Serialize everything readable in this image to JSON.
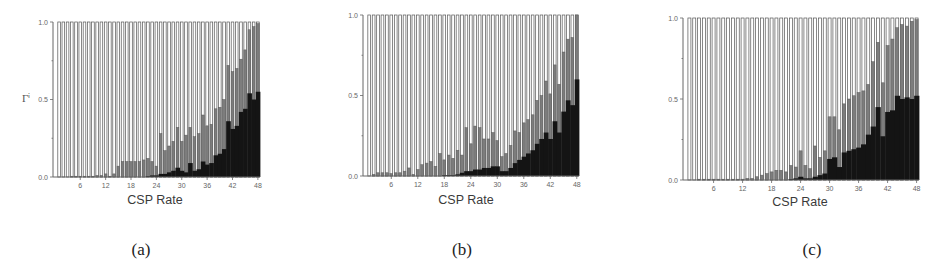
{
  "figure": {
    "panels": [
      {
        "caption": "(a)",
        "xlabel": "CSP Rate",
        "ylabel": "Γⁱ"
      },
      {
        "caption": "(b)",
        "xlabel": "CSP Rate",
        "ylabel": ""
      },
      {
        "caption": "(c)",
        "xlabel": "CSP Rate",
        "ylabel": ""
      }
    ],
    "colors": {
      "light": "#ffffff",
      "mid": "#7d7d7d",
      "dark": "#141414",
      "outline": "#555555"
    }
  },
  "chart_data": [
    {
      "type": "bar",
      "stacked": true,
      "title": "(a)",
      "xlabel": "CSP Rate",
      "ylabel": "Γⁱ",
      "ylim": [
        0,
        1
      ],
      "yticks": [
        "0.0",
        "0.5",
        "1.0"
      ],
      "xticks": [
        6,
        12,
        18,
        24,
        30,
        36,
        42,
        48
      ],
      "x": [
        1,
        2,
        3,
        4,
        5,
        6,
        7,
        8,
        9,
        10,
        11,
        12,
        13,
        14,
        15,
        16,
        17,
        18,
        19,
        20,
        21,
        22,
        23,
        24,
        25,
        26,
        27,
        28,
        29,
        30,
        31,
        32,
        33,
        34,
        35,
        36,
        37,
        38,
        39,
        40,
        41,
        42,
        43,
        44,
        45,
        46,
        47,
        48
      ],
      "series": [
        {
          "name": "dark",
          "values": [
            0,
            0,
            0,
            0,
            0,
            0,
            0,
            0,
            0,
            0,
            0,
            0,
            0,
            0,
            0,
            0,
            0,
            0,
            0,
            0,
            0,
            0.005,
            0.01,
            0.01,
            0.02,
            0.02,
            0.03,
            0.04,
            0.06,
            0.04,
            0.03,
            0.09,
            0.04,
            0.05,
            0.1,
            0.08,
            0.09,
            0.14,
            0.15,
            0.18,
            0.36,
            0.31,
            0.33,
            0.42,
            0.44,
            0.54,
            0.5,
            0.55
          ]
        },
        {
          "name": "mid_top",
          "values": [
            0,
            0,
            0,
            0.005,
            0.005,
            0.005,
            0.005,
            0.005,
            0.005,
            0.01,
            0.01,
            0.02,
            0.005,
            0.02,
            0.07,
            0.1,
            0.1,
            0.1,
            0.1,
            0.1,
            0.11,
            0.12,
            0.1,
            0.07,
            0.28,
            0.17,
            0.2,
            0.23,
            0.32,
            0.23,
            0.27,
            0.32,
            0.26,
            0.28,
            0.4,
            0.33,
            0.34,
            0.44,
            0.45,
            0.5,
            0.72,
            0.68,
            0.7,
            0.76,
            0.82,
            0.95,
            0.97,
            0.99
          ]
        },
        {
          "name": "white_top",
          "values": [
            1,
            1,
            1,
            1,
            1,
            1,
            1,
            1,
            1,
            1,
            1,
            1,
            1,
            1,
            1,
            1,
            1,
            1,
            1,
            1,
            1,
            1,
            1,
            1,
            1,
            1,
            1,
            1,
            1,
            1,
            1,
            1,
            1,
            1,
            1,
            1,
            1,
            1,
            1,
            1,
            1,
            1,
            1,
            1,
            1,
            1,
            1,
            1
          ]
        }
      ]
    },
    {
      "type": "bar",
      "stacked": true,
      "title": "(b)",
      "xlabel": "CSP Rate",
      "ylabel": "",
      "ylim": [
        0,
        1
      ],
      "yticks": [
        "0.0",
        "0.5",
        "1.0"
      ],
      "xticks": [
        6,
        12,
        18,
        24,
        30,
        36,
        42,
        48
      ],
      "x": [
        1,
        2,
        3,
        4,
        5,
        6,
        7,
        8,
        9,
        10,
        11,
        12,
        13,
        14,
        15,
        16,
        17,
        18,
        19,
        20,
        21,
        22,
        23,
        24,
        25,
        26,
        27,
        28,
        29,
        30,
        31,
        32,
        33,
        34,
        35,
        36,
        37,
        38,
        39,
        40,
        41,
        42,
        43,
        44,
        45,
        46,
        47,
        48
      ],
      "series": [
        {
          "name": "dark",
          "values": [
            0,
            0,
            0,
            0,
            0,
            0,
            0,
            0,
            0,
            0,
            0,
            0,
            0,
            0,
            0,
            0,
            0,
            0.005,
            0.005,
            0.005,
            0.01,
            0.02,
            0.03,
            0.03,
            0.04,
            0.04,
            0.05,
            0.05,
            0.06,
            0.06,
            0.03,
            0.03,
            0.05,
            0.08,
            0.1,
            0.12,
            0.14,
            0.16,
            0.2,
            0.23,
            0.27,
            0.23,
            0.34,
            0.27,
            0.4,
            0.47,
            0.44,
            0.6
          ]
        },
        {
          "name": "mid_top",
          "values": [
            0,
            0.01,
            0.02,
            0.02,
            0.02,
            0.015,
            0.02,
            0.02,
            0.03,
            0.05,
            0.01,
            0.04,
            0.07,
            0.08,
            0.09,
            0.06,
            0.14,
            0.1,
            0.13,
            0.11,
            0.16,
            0.13,
            0.3,
            0.2,
            0.31,
            0.3,
            0.23,
            0.23,
            0.27,
            0.22,
            0.12,
            0.14,
            0.19,
            0.28,
            0.27,
            0.33,
            0.35,
            0.38,
            0.47,
            0.5,
            0.59,
            0.51,
            0.69,
            0.57,
            0.77,
            0.85,
            0.86,
            1.0
          ]
        },
        {
          "name": "white_top",
          "values": [
            1,
            1,
            1,
            1,
            1,
            1,
            1,
            1,
            1,
            1,
            1,
            1,
            1,
            1,
            1,
            1,
            1,
            1,
            1,
            1,
            1,
            1,
            1,
            1,
            1,
            1,
            1,
            1,
            1,
            1,
            1,
            1,
            1,
            1,
            1,
            1,
            1,
            1,
            1,
            1,
            1,
            1,
            1,
            1,
            1,
            1,
            1,
            1
          ]
        }
      ]
    },
    {
      "type": "bar",
      "stacked": true,
      "title": "(c)",
      "xlabel": "CSP Rate",
      "ylabel": "",
      "ylim": [
        0,
        1
      ],
      "yticks": [
        "0.0",
        "0.5",
        "1.0"
      ],
      "xticks": [
        6,
        12,
        18,
        24,
        30,
        36,
        42,
        48
      ],
      "x": [
        1,
        2,
        3,
        4,
        5,
        6,
        7,
        8,
        9,
        10,
        11,
        12,
        13,
        14,
        15,
        16,
        17,
        18,
        19,
        20,
        21,
        22,
        23,
        24,
        25,
        26,
        27,
        28,
        29,
        30,
        31,
        32,
        33,
        34,
        35,
        36,
        37,
        38,
        39,
        40,
        41,
        42,
        43,
        44,
        45,
        46,
        47,
        48
      ],
      "series": [
        {
          "name": "dark",
          "values": [
            0,
            0,
            0,
            0,
            0,
            0,
            0,
            0,
            0,
            0,
            0,
            0,
            0,
            0,
            0,
            0,
            0,
            0,
            0,
            0,
            0,
            0.005,
            0.01,
            0.02,
            0.01,
            0.01,
            0.02,
            0.03,
            0.04,
            0.13,
            0.14,
            0.08,
            0.17,
            0.18,
            0.19,
            0.2,
            0.22,
            0.28,
            0.33,
            0.45,
            0.27,
            0.42,
            0.43,
            0.52,
            0.5,
            0.51,
            0.5,
            0.52
          ]
        },
        {
          "name": "mid_top",
          "values": [
            0,
            0,
            0.005,
            0.005,
            0.005,
            0.005,
            0.005,
            0.005,
            0.005,
            0.005,
            0.005,
            0.005,
            0.01,
            0.01,
            0.02,
            0.03,
            0.04,
            0.05,
            0.06,
            0.06,
            0.05,
            0.09,
            0.08,
            0.18,
            0.09,
            0.07,
            0.21,
            0.14,
            0.18,
            0.39,
            0.39,
            0.31,
            0.47,
            0.5,
            0.52,
            0.54,
            0.55,
            0.59,
            0.73,
            0.85,
            0.6,
            0.83,
            0.87,
            0.94,
            0.96,
            0.95,
            0.98,
            0.99
          ]
        },
        {
          "name": "white_top",
          "values": [
            1,
            1,
            1,
            1,
            1,
            1,
            1,
            1,
            1,
            1,
            1,
            1,
            1,
            1,
            1,
            1,
            1,
            1,
            1,
            1,
            1,
            1,
            1,
            1,
            1,
            1,
            1,
            1,
            1,
            1,
            1,
            1,
            1,
            1,
            1,
            1,
            1,
            1,
            1,
            1,
            1,
            1,
            1,
            1,
            1,
            1,
            1,
            1
          ]
        }
      ]
    }
  ]
}
